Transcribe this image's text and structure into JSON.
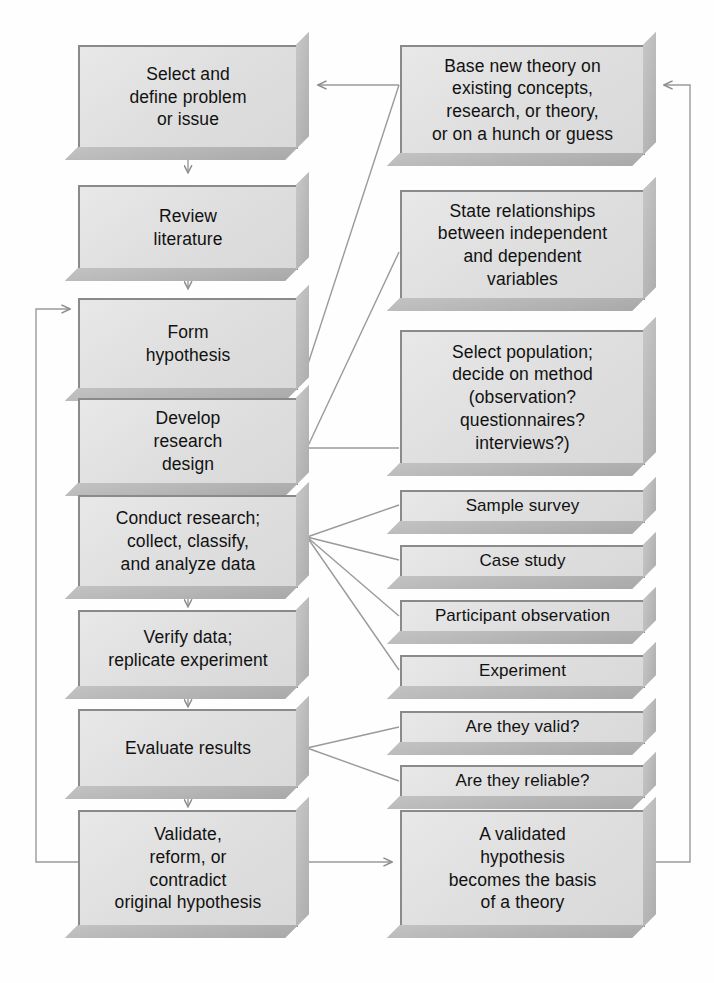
{
  "diagram": {
    "type": "flowchart",
    "box_fill": "#e2e2e2",
    "box_border": "#8a8a8a",
    "shadow_color": "#b5b5b5",
    "connector_color": "#9a9a9a",
    "background": "#fefefe"
  },
  "left_column": [
    {
      "id": "select-define-problem",
      "label": "Select and\ndefine problem\nor issue"
    },
    {
      "id": "review-literature",
      "label": "Review\nliterature"
    },
    {
      "id": "form-hypothesis",
      "label": "Form\nhypothesis"
    },
    {
      "id": "develop-research-design",
      "label": "Develop\nresearch\ndesign"
    },
    {
      "id": "conduct-research",
      "label": "Conduct research;\ncollect, classify,\nand analyze data"
    },
    {
      "id": "verify-data",
      "label": "Verify data;\nreplicate experiment"
    },
    {
      "id": "evaluate-results",
      "label": "Evaluate results"
    },
    {
      "id": "validate-reform",
      "label": "Validate,\nreform, or\ncontradict\noriginal hypothesis"
    }
  ],
  "right_column": [
    {
      "id": "base-new-theory",
      "label": "Base new theory on\nexisting concepts,\nresearch, or theory,\nor on a hunch or guess"
    },
    {
      "id": "state-relationships",
      "label": "State relationships\nbetween independent\nand dependent\nvariables"
    },
    {
      "id": "select-population",
      "label": "Select population;\ndecide on method\n(observation?\nquestionnaires?\ninterviews?)"
    },
    {
      "id": "sample-survey",
      "label": "Sample survey"
    },
    {
      "id": "case-study",
      "label": "Case study"
    },
    {
      "id": "participant-observation",
      "label": "Participant observation"
    },
    {
      "id": "experiment",
      "label": "Experiment"
    },
    {
      "id": "are-they-valid",
      "label": "Are they valid?"
    },
    {
      "id": "are-they-reliable",
      "label": "Are they reliable?"
    },
    {
      "id": "validated-hypothesis",
      "label": "A validated\nhypothesis\nbecomes the basis\nof a theory"
    }
  ],
  "connections": [
    {
      "from": "select-define-problem",
      "to": "review-literature",
      "style": "arrow-down"
    },
    {
      "from": "review-literature",
      "to": "form-hypothesis",
      "style": "arrow-down"
    },
    {
      "from": "form-hypothesis",
      "to": "develop-research-design",
      "style": "arrow-down"
    },
    {
      "from": "develop-research-design",
      "to": "conduct-research",
      "style": "arrow-down"
    },
    {
      "from": "conduct-research",
      "to": "verify-data",
      "style": "arrow-down"
    },
    {
      "from": "verify-data",
      "to": "evaluate-results",
      "style": "arrow-down"
    },
    {
      "from": "evaluate-results",
      "to": "validate-reform",
      "style": "arrow-down"
    },
    {
      "from": "base-new-theory",
      "to": "select-define-problem",
      "style": "arrow-left"
    },
    {
      "from": "base-new-theory",
      "to": "form-hypothesis",
      "style": "diagonal"
    },
    {
      "from": "state-relationships",
      "to": "develop-research-design",
      "style": "diagonal"
    },
    {
      "from": "select-population",
      "to": "develop-research-design",
      "style": "line-left"
    },
    {
      "from": "conduct-research",
      "to": "sample-survey",
      "style": "fan"
    },
    {
      "from": "conduct-research",
      "to": "case-study",
      "style": "fan"
    },
    {
      "from": "conduct-research",
      "to": "participant-observation",
      "style": "fan"
    },
    {
      "from": "conduct-research",
      "to": "experiment",
      "style": "fan"
    },
    {
      "from": "evaluate-results",
      "to": "are-they-valid",
      "style": "fan"
    },
    {
      "from": "evaluate-results",
      "to": "are-they-reliable",
      "style": "fan"
    },
    {
      "from": "validate-reform",
      "to": "validated-hypothesis",
      "style": "arrow-right"
    },
    {
      "from": "validate-reform",
      "to": "form-hypothesis",
      "style": "feedback-loop-left"
    },
    {
      "from": "validated-hypothesis",
      "to": "base-new-theory",
      "style": "feedback-loop-right"
    }
  ]
}
